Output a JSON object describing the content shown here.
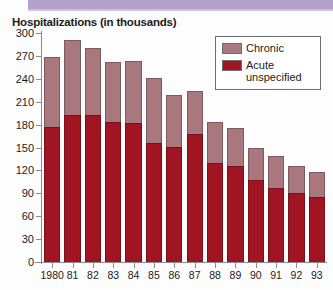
{
  "title": "Hospitalizations (in thousands)",
  "colors": {
    "band": "#b4a0cc",
    "chronic": "#a9787e",
    "acute": "#a11523",
    "axis": "#8a8a8a",
    "text": "#1b1b1b"
  },
  "legend": {
    "items": [
      {
        "label": "Chronic",
        "color": "#a9787e",
        "swatch": "chronic-swatch"
      },
      {
        "label": "Acute unspecified",
        "color": "#a11523",
        "swatch": "acute-swatch"
      }
    ]
  },
  "axes": {
    "y_ticks": [
      "300",
      "270",
      "240",
      "210",
      "180",
      "150",
      "120",
      "90",
      "60",
      "30",
      "0"
    ],
    "x_ticks": [
      "1980",
      "81",
      "82",
      "83",
      "84",
      "85",
      "86",
      "87",
      "88",
      "89",
      "90",
      "91",
      "92",
      "93"
    ]
  },
  "chart_data": {
    "type": "bar",
    "stacked": true,
    "title": "Hospitalizations (in thousands)",
    "xlabel": "",
    "ylabel": "",
    "ylim": [
      0,
      300
    ],
    "ytick_step": 30,
    "grid": false,
    "legend_position": "top-right",
    "categories": [
      "1980",
      "81",
      "82",
      "83",
      "84",
      "85",
      "86",
      "87",
      "88",
      "89",
      "90",
      "91",
      "92",
      "93"
    ],
    "series": [
      {
        "name": "Acute unspecified",
        "color": "#a11523",
        "values": [
          177,
          192,
          192,
          183,
          182,
          156,
          150,
          168,
          130,
          126,
          107,
          97,
          90,
          85
        ]
      },
      {
        "name": "Chronic",
        "color": "#a9787e",
        "values": [
          91,
          99,
          88,
          79,
          81,
          85,
          69,
          56,
          53,
          50,
          42,
          42,
          36,
          33
        ]
      }
    ],
    "totals": [
      268,
      291,
      280,
      262,
      263,
      241,
      219,
      224,
      183,
      176,
      149,
      139,
      126,
      118
    ]
  }
}
